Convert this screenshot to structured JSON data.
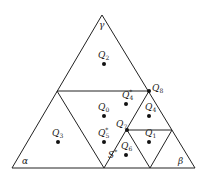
{
  "diagram": {
    "vertices": {
      "gamma": {
        "label": "γ",
        "x": 102,
        "y": 15
      },
      "alpha": {
        "label": "α",
        "x": 12,
        "y": 168
      },
      "beta": {
        "label": "β",
        "x": 195,
        "y": 168
      }
    },
    "points": [
      {
        "id": "Q2",
        "base": "Q",
        "sub": "2",
        "x": 104,
        "y": 64,
        "lx": 98,
        "ly": 58
      },
      {
        "id": "Q8",
        "base": "Q",
        "sub": "8",
        "x": 149,
        "y": 91,
        "lx": 152,
        "ly": 91
      },
      {
        "id": "Q4*",
        "base": "Q",
        "sub": "4",
        "sup": "*",
        "x": 126,
        "y": 104,
        "lx": 122,
        "ly": 98
      },
      {
        "id": "Q0",
        "base": "Q",
        "sub": "0",
        "x": 104,
        "y": 116,
        "lx": 98,
        "ly": 110
      },
      {
        "id": "Q4",
        "base": "Q",
        "sub": "4",
        "x": 149,
        "y": 116,
        "lx": 145,
        "ly": 110
      },
      {
        "id": "Q7",
        "base": "Q",
        "sub": "7",
        "x": 127,
        "y": 130,
        "lx": 116,
        "ly": 127
      },
      {
        "id": "Q3",
        "base": "Q",
        "sub": "3",
        "x": 58,
        "y": 142,
        "lx": 52,
        "ly": 136
      },
      {
        "id": "Q5*",
        "base": "Q",
        "sub": "5",
        "sup": "*",
        "x": 104,
        "y": 142,
        "lx": 98,
        "ly": 136
      },
      {
        "id": "Q1",
        "base": "Q",
        "sub": "1",
        "x": 149,
        "y": 142,
        "lx": 145,
        "ly": 136
      },
      {
        "id": "Q6",
        "base": "Q",
        "sub": "6",
        "x": 126,
        "y": 155,
        "lx": 121,
        "ly": 149
      }
    ],
    "annotation": {
      "label": "S",
      "sup": "*",
      "x": 108,
      "y": 158
    }
  }
}
